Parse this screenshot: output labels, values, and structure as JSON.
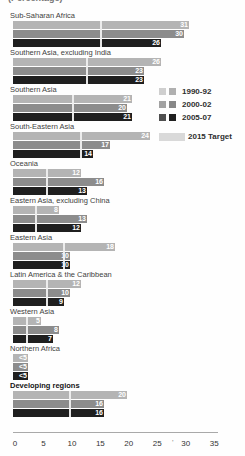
{
  "caption_partial": "(Percentage)",
  "colors": {
    "bar_1990_92": "#b4b4b4",
    "bar_2000_02": "#8c8c8c",
    "bar_2005_07": "#1f1f1f",
    "target_line": "#efefef",
    "target_swatch": "#d9d9d9",
    "legend_swatch_pairs": [
      [
        "#cfcfcf",
        "#b0b0b0"
      ],
      [
        "#a2a2a2",
        "#878787"
      ],
      [
        "#4f4f4f",
        "#1f1f1f"
      ]
    ],
    "axis_line": "#a9a9a9",
    "label_text": "#3f3f3f",
    "value_text": "#ffffff"
  },
  "legend": {
    "period_labels": [
      "1990-92",
      "2000-02",
      "2005-07"
    ],
    "target_label": "2015 Target"
  },
  "chart_data": {
    "type": "bar",
    "orientation": "horizontal",
    "caption_partial": "(Percentage)",
    "series_names": [
      "1990-92",
      "2000-02",
      "2005-07"
    ],
    "target_name": "2015 Target",
    "xlim": [
      0,
      35
    ],
    "x_ticks": [
      0,
      5,
      10,
      15,
      20,
      25,
      30,
      35
    ],
    "axis_artifact": "'",
    "groups": [
      {
        "region": "Sub-Saharan Africa",
        "bold": false,
        "values": [
          31,
          30,
          26
        ],
        "labels": [
          "31",
          "30",
          "26"
        ],
        "target": 15.5
      },
      {
        "region": "Southern Asia, excluding India",
        "bold": false,
        "values": [
          26,
          23,
          23
        ],
        "labels": [
          "26",
          "23",
          "23"
        ],
        "target": 13
      },
      {
        "region": "Southern Asia",
        "bold": false,
        "values": [
          21,
          20,
          21
        ],
        "labels": [
          "21",
          "20",
          "21"
        ],
        "target": 10.5
      },
      {
        "region": "South-Eastern Asia",
        "bold": false,
        "values": [
          24,
          17,
          14
        ],
        "labels": [
          "24",
          "17",
          "14"
        ],
        "target": 12
      },
      {
        "region": "Oceania",
        "bold": false,
        "values": [
          12,
          16,
          13
        ],
        "labels": [
          "12",
          "16",
          "13"
        ],
        "target": 6
      },
      {
        "region": "Eastern Asia, excluding China",
        "bold": false,
        "values": [
          8,
          13,
          12
        ],
        "labels": [
          "8",
          "13",
          "12"
        ],
        "target": 4
      },
      {
        "region": "Eastern Asia",
        "bold": false,
        "values": [
          18,
          10,
          10
        ],
        "labels": [
          "18",
          "10",
          "10"
        ],
        "target": 9
      },
      {
        "region": "Latin America & the Caribbean",
        "bold": false,
        "values": [
          12,
          10,
          9
        ],
        "labels": [
          "12",
          "10",
          "9"
        ],
        "target": 6
      },
      {
        "region": "Western Asia",
        "bold": false,
        "values": [
          5,
          8,
          7
        ],
        "labels": [
          "5",
          "8",
          "7"
        ],
        "target": 2.5
      },
      {
        "region": "Northern Africa",
        "bold": false,
        "values": [
          2.7,
          2.7,
          2.7
        ],
        "labels": [
          "<5",
          "<5",
          "<5"
        ],
        "target": null
      },
      {
        "region": "Developing regions",
        "bold": true,
        "values": [
          20,
          16,
          16
        ],
        "labels": [
          "20",
          "16",
          "16"
        ],
        "target": 10
      }
    ]
  }
}
